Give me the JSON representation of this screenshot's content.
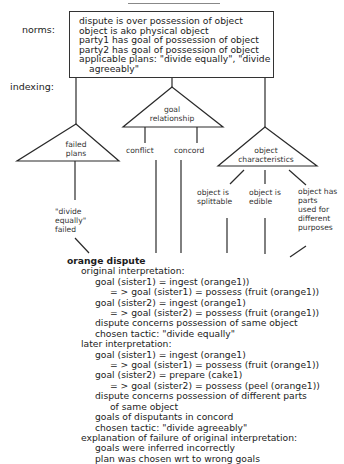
{
  "title": "Annotation tree",
  "labels": {
    "norms": "norms:",
    "indexing": "indexing:"
  },
  "norms": [
    "dispute is over possession of object",
    "object is ako physical object",
    "party1 has goal of possession of object",
    "party2 has goal of possession of object",
    "applicable plans:  \"divide equally\", \"divide",
    "agreeably\""
  ],
  "indexes": {
    "failed_plans": {
      "label_line1": "failed",
      "label_line2": "plans",
      "children": [
        "\"divide",
        "equally\"",
        "failed"
      ]
    },
    "goal_relationship": {
      "label_line1": "goal",
      "label_line2": "relationship",
      "children": [
        "conflict",
        "concord"
      ]
    },
    "object_characteristics": {
      "label_line1": "object",
      "label_line2": "characteristics",
      "children": [
        {
          "lines": [
            "object is",
            "splittable"
          ]
        },
        {
          "lines": [
            "object is",
            "edible"
          ]
        },
        {
          "lines": [
            "object has",
            "parts",
            "used for",
            "different",
            "purposes"
          ]
        }
      ]
    }
  },
  "case": {
    "title": "orange dispute",
    "lines": [
      {
        "indent": 1,
        "text": "original interpretation:"
      },
      {
        "indent": 2,
        "text": "goal (sister1) = ingest (orange1))"
      },
      {
        "indent": 3,
        "text": "= > goal (sister1) = possess (fruit (orange1))"
      },
      {
        "indent": 2,
        "text": "goal (sister2) = ingest (orange1)"
      },
      {
        "indent": 3,
        "text": "= > goal (sister2) = possess (fruit (orange1))"
      },
      {
        "indent": 2,
        "text": "dispute concerns possession of same object"
      },
      {
        "indent": 2,
        "text": "chosen tactic:  \"divide equally\""
      },
      {
        "indent": 1,
        "text": "later interpretation:"
      },
      {
        "indent": 2,
        "text": "goal (sister1) = ingest (orange1)"
      },
      {
        "indent": 3,
        "text": "= > goal (sister1) = possess (fruit (orange1))"
      },
      {
        "indent": 2,
        "text": "goal (sister2) = prepare (cake1)"
      },
      {
        "indent": 3,
        "text": "= > goal (sister2) = possess (peel (orange1))"
      },
      {
        "indent": 2,
        "text": "dispute concerns possession of different parts"
      },
      {
        "indent": 3,
        "text": "of same object"
      },
      {
        "indent": 2,
        "text": "goals of disputants in concord"
      },
      {
        "indent": 2,
        "text": "chosen tactic:  \"divide agreeably\""
      },
      {
        "indent": 1,
        "text": "explanation of failure of original interpretation:"
      },
      {
        "indent": 2,
        "text": "goals were inferred incorrectly"
      },
      {
        "indent": 2,
        "text": "plan was chosen wrt to wrong goals"
      }
    ]
  }
}
